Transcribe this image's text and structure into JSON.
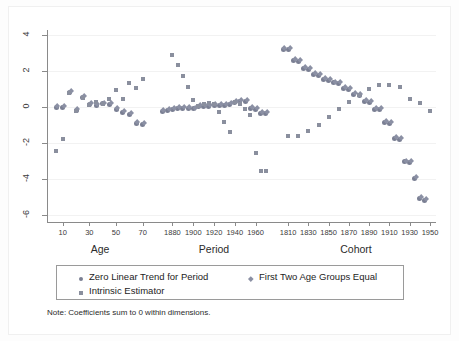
{
  "figure": {
    "note": "Note: Coefficients sum to 0 within dimensions.",
    "background": "#ffffff",
    "axis_color": "#8a8a8a"
  },
  "legend": {
    "items": [
      {
        "label": "Zero Linear Trend for Period",
        "marker": "circle",
        "color": "#7a7f93"
      },
      {
        "label": "First Two Age Groups Equal",
        "marker": "diamond",
        "color": "#8b90a4"
      },
      {
        "label": "Intrinsic Estimator",
        "marker": "square",
        "color": "#8a8f9e"
      }
    ]
  },
  "chart_data": {
    "type": "scatter",
    "title": "",
    "xlabel": "",
    "ylabel": "",
    "ylim": [
      -6.4,
      4.3
    ],
    "yticks": [
      4,
      2,
      0,
      -2,
      -4,
      -6
    ],
    "ytick_labels": [
      "4",
      "2",
      "0",
      "-2",
      "-4",
      "-6"
    ],
    "grid": true,
    "legend_position": "below-axis",
    "dimensions": [
      {
        "name": "Age",
        "tick_values": [
          10,
          30,
          50,
          70
        ],
        "tick_labels": [
          "10",
          "30",
          "50",
          "70"
        ]
      },
      {
        "name": "Period",
        "tick_values": [
          1880,
          1900,
          1920,
          1940,
          1960
        ],
        "tick_labels": [
          "1880",
          "1900",
          "1920",
          "1940",
          "1960"
        ]
      },
      {
        "name": "Cohort",
        "tick_values": [
          1810,
          1830,
          1850,
          1870,
          1890,
          1910,
          1930,
          1950
        ],
        "tick_labels": [
          "1810",
          "1830",
          "1850",
          "1870",
          "1890",
          "1910",
          "1930",
          "1950"
        ]
      }
    ],
    "series": [
      {
        "name": "Zero Linear Trend for Period",
        "marker": "circle",
        "dimension": "Age",
        "x": [
          5,
          10,
          15,
          20,
          25,
          30,
          35,
          40,
          45,
          50,
          55,
          60,
          65,
          70
        ],
        "values": [
          -0.02,
          -0.02,
          0.82,
          -0.18,
          0.52,
          0.14,
          0.12,
          0.18,
          0.14,
          -0.12,
          -0.3,
          -0.42,
          -0.9,
          -0.95
        ]
      },
      {
        "name": "First Two Age Groups Equal",
        "marker": "diamond",
        "dimension": "Age",
        "x": [
          5,
          10,
          15,
          20,
          25,
          30,
          35,
          40,
          45,
          50,
          55,
          60,
          65,
          70
        ],
        "values": [
          -0.02,
          -0.02,
          0.82,
          -0.18,
          0.52,
          0.14,
          0.12,
          0.18,
          0.14,
          -0.12,
          -0.3,
          -0.42,
          -0.9,
          -0.95
        ]
      },
      {
        "name": "Intrinsic Estimator",
        "marker": "square",
        "dimension": "Age",
        "x": [
          5,
          10,
          15,
          20,
          25,
          30,
          35,
          40,
          45,
          50,
          55,
          60,
          65,
          70
        ],
        "values": [
          -2.45,
          -1.8,
          0.8,
          -0.22,
          0.5,
          0.12,
          0.3,
          0.18,
          0.48,
          0.95,
          0.45,
          1.35,
          1.05,
          1.55
        ]
      },
      {
        "name": "Zero Linear Trend for Period",
        "marker": "circle",
        "dimension": "Period",
        "x": [
          1870,
          1875,
          1880,
          1885,
          1890,
          1895,
          1900,
          1905,
          1910,
          1915,
          1920,
          1925,
          1930,
          1935,
          1940,
          1945,
          1950,
          1955,
          1960,
          1965,
          1970
        ],
        "values": [
          -0.22,
          -0.18,
          -0.12,
          -0.05,
          -0.06,
          -0.08,
          -0.1,
          0.02,
          0.05,
          0.06,
          0.08,
          0.1,
          0.12,
          0.14,
          0.25,
          0.3,
          0.3,
          -0.08,
          -0.12,
          -0.35,
          -0.35
        ]
      },
      {
        "name": "First Two Age Groups Equal",
        "marker": "diamond",
        "dimension": "Period",
        "x": [
          1870,
          1875,
          1880,
          1885,
          1890,
          1895,
          1900,
          1905,
          1910,
          1915,
          1920,
          1925,
          1930,
          1935,
          1940,
          1945,
          1950,
          1955,
          1960,
          1965,
          1970
        ],
        "values": [
          -0.22,
          -0.18,
          -0.12,
          -0.05,
          -0.06,
          -0.08,
          -0.1,
          0.02,
          0.05,
          0.06,
          0.08,
          0.1,
          0.12,
          0.14,
          0.25,
          0.3,
          0.3,
          -0.08,
          -0.12,
          -0.35,
          -0.35
        ]
      },
      {
        "name": "Intrinsic Estimator",
        "marker": "square",
        "dimension": "Period",
        "x": [
          1880,
          1885,
          1890,
          1895,
          1900,
          1905,
          1910,
          1915,
          1920,
          1925,
          1930,
          1935,
          1940,
          1945,
          1950,
          1955,
          1960,
          1965,
          1970
        ],
        "values": [
          2.9,
          2.35,
          1.75,
          1.1,
          0.42,
          0.05,
          0.18,
          0.22,
          0.2,
          -0.25,
          -0.85,
          -1.4,
          0.3,
          0.18,
          -0.1,
          -0.45,
          -2.55,
          -3.55,
          -3.55
        ]
      },
      {
        "name": "Zero Linear Trend for Period",
        "marker": "circle",
        "dimension": "Cohort",
        "x": [
          1805,
          1810,
          1815,
          1820,
          1825,
          1830,
          1835,
          1840,
          1845,
          1850,
          1855,
          1860,
          1865,
          1870,
          1875,
          1880,
          1885,
          1890,
          1895,
          1900,
          1905,
          1910,
          1915,
          1920,
          1925,
          1930,
          1935,
          1940,
          1945
        ],
        "values": [
          3.2,
          3.2,
          2.6,
          2.55,
          2.15,
          2.1,
          1.8,
          1.75,
          1.55,
          1.5,
          1.35,
          1.3,
          1.05,
          1.0,
          0.7,
          0.65,
          0.3,
          0.25,
          -0.12,
          -0.15,
          -0.85,
          -0.9,
          -1.75,
          -1.8,
          -3.05,
          -3.1,
          -3.95,
          -5.1,
          -5.2
        ]
      },
      {
        "name": "First Two Age Groups Equal",
        "marker": "diamond",
        "dimension": "Cohort",
        "x": [
          1805,
          1810,
          1815,
          1820,
          1825,
          1830,
          1835,
          1840,
          1845,
          1850,
          1855,
          1860,
          1865,
          1870,
          1875,
          1880,
          1885,
          1890,
          1895,
          1900,
          1905,
          1910,
          1915,
          1920,
          1925,
          1930,
          1935,
          1940,
          1945
        ],
        "values": [
          3.2,
          3.2,
          2.6,
          2.55,
          2.15,
          2.1,
          1.8,
          1.75,
          1.55,
          1.5,
          1.35,
          1.3,
          1.05,
          1.0,
          0.7,
          0.65,
          0.3,
          0.25,
          -0.12,
          -0.15,
          -0.85,
          -0.9,
          -1.75,
          -1.8,
          -3.05,
          -3.1,
          -3.95,
          -5.1,
          -5.2
        ]
      },
      {
        "name": "Intrinsic Estimator",
        "marker": "square",
        "dimension": "Cohort",
        "x": [
          1810,
          1820,
          1830,
          1840,
          1850,
          1860,
          1870,
          1880,
          1890,
          1900,
          1910,
          1920,
          1930,
          1940,
          1950
        ],
        "values": [
          -1.6,
          -1.6,
          -1.35,
          -1.0,
          -0.55,
          -0.08,
          0.28,
          0.7,
          1.0,
          1.25,
          1.25,
          1.1,
          0.45,
          0.25,
          -0.2
        ]
      }
    ]
  }
}
